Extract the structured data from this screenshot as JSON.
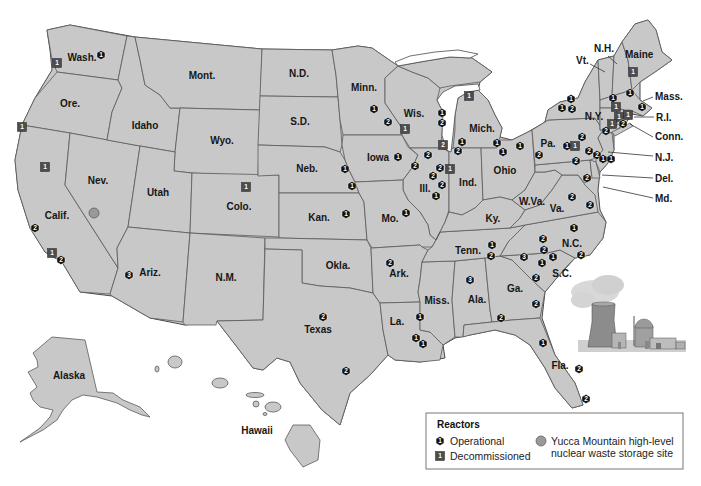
{
  "map": {
    "title": "Nuclear reactors in the United States",
    "colors": {
      "land": "#c8c8c8",
      "border": "#5a5a5a",
      "operational": "#111111",
      "decommissioned": "#4d4d4d",
      "yucca": "#9a9a9a"
    }
  },
  "legend": {
    "title": "Reactors",
    "operational": "Operational",
    "decommissioned": "Decommissioned",
    "yucca_line1": "Yucca Mountain high-level",
    "yucca_line2": "nuclear waste storage site",
    "operational_icon_num": "1",
    "decommissioned_icon_num": "1"
  },
  "state_labels": [
    {
      "text": "Wash.",
      "x": 82,
      "y": 61
    },
    {
      "text": "Ore.",
      "x": 70,
      "y": 107
    },
    {
      "text": "Calif.",
      "x": 57,
      "y": 219
    },
    {
      "text": "Nev.",
      "x": 98,
      "y": 184
    },
    {
      "text": "Idaho",
      "x": 145,
      "y": 129
    },
    {
      "text": "Mont.",
      "x": 202,
      "y": 79
    },
    {
      "text": "Wyo.",
      "x": 222,
      "y": 144
    },
    {
      "text": "Utah",
      "x": 158,
      "y": 196
    },
    {
      "text": "Ariz.",
      "x": 150,
      "y": 276
    },
    {
      "text": "Colo.",
      "x": 239,
      "y": 210
    },
    {
      "text": "N.M.",
      "x": 226,
      "y": 281
    },
    {
      "text": "N.D.",
      "x": 299,
      "y": 77
    },
    {
      "text": "S.D.",
      "x": 300,
      "y": 125
    },
    {
      "text": "Neb.",
      "x": 307,
      "y": 172
    },
    {
      "text": "Kan.",
      "x": 319,
      "y": 221
    },
    {
      "text": "Okla.",
      "x": 338,
      "y": 269
    },
    {
      "text": "Texas",
      "x": 318,
      "y": 333
    },
    {
      "text": "Minn.",
      "x": 364,
      "y": 91
    },
    {
      "text": "Iowa",
      "x": 378,
      "y": 161
    },
    {
      "text": "Mo.",
      "x": 390,
      "y": 222
    },
    {
      "text": "Ark.",
      "x": 399,
      "y": 277
    },
    {
      "text": "La.",
      "x": 397,
      "y": 325
    },
    {
      "text": "Wis.",
      "x": 414,
      "y": 117
    },
    {
      "text": "Ill.",
      "x": 425,
      "y": 192
    },
    {
      "text": "Miss.",
      "x": 437,
      "y": 304
    },
    {
      "text": "Mich.",
      "x": 482,
      "y": 132
    },
    {
      "text": "Ind.",
      "x": 468,
      "y": 186
    },
    {
      "text": "Ky.",
      "x": 493,
      "y": 222
    },
    {
      "text": "Tenn.",
      "x": 468,
      "y": 254
    },
    {
      "text": "Ala.",
      "x": 477,
      "y": 303
    },
    {
      "text": "Ohio",
      "x": 505,
      "y": 174
    },
    {
      "text": "W.Va.",
      "x": 532,
      "y": 205
    },
    {
      "text": "Va.",
      "x": 557,
      "y": 212
    },
    {
      "text": "N.C.",
      "x": 572,
      "y": 247
    },
    {
      "text": "S.C.",
      "x": 562,
      "y": 277
    },
    {
      "text": "Ga.",
      "x": 515,
      "y": 292
    },
    {
      "text": "Fla.",
      "x": 560,
      "y": 369
    },
    {
      "text": "Pa.",
      "x": 548,
      "y": 147
    },
    {
      "text": "N.Y.",
      "x": 594,
      "y": 120
    },
    {
      "text": "Alaska",
      "x": 69,
      "y": 379
    },
    {
      "text": "Hawaii",
      "x": 257,
      "y": 434
    }
  ],
  "callout_labels": [
    {
      "text": "N.H.",
      "x": 594,
      "y": 52,
      "line": [
        608,
        56,
        617,
        64
      ]
    },
    {
      "text": "Vt.",
      "x": 576,
      "y": 64,
      "line": [
        590,
        64,
        605,
        72
      ]
    },
    {
      "text": "Maine",
      "x": 625,
      "y": 58,
      "line": null
    },
    {
      "text": "Mass.",
      "x": 655,
      "y": 100,
      "line": [
        653,
        97,
        643,
        101
      ]
    },
    {
      "text": "R.I.",
      "x": 656,
      "y": 121,
      "line": [
        654,
        117,
        634,
        117
      ]
    },
    {
      "text": "Conn.",
      "x": 655,
      "y": 140,
      "line": [
        653,
        137,
        630,
        124
      ]
    },
    {
      "text": "N.J.",
      "x": 655,
      "y": 161,
      "line": [
        653,
        156,
        608,
        152
      ]
    },
    {
      "text": "Del.",
      "x": 655,
      "y": 182,
      "line": [
        653,
        178,
        602,
        175
      ]
    },
    {
      "text": "Md.",
      "x": 655,
      "y": 202,
      "line": [
        653,
        198,
        603,
        187
      ]
    }
  ],
  "reactors": [
    {
      "state": "Wash.",
      "type": "operational",
      "n": "1",
      "x": 101,
      "y": 55
    },
    {
      "state": "Wash.",
      "type": "decommissioned",
      "n": "1",
      "x": 57,
      "y": 63
    },
    {
      "state": "Ore.",
      "type": "decommissioned",
      "n": "1",
      "x": 22,
      "y": 127
    },
    {
      "state": "Calif.",
      "type": "decommissioned",
      "n": "1",
      "x": 45,
      "y": 167
    },
    {
      "state": "Calif.",
      "type": "operational",
      "n": "2",
      "x": 35,
      "y": 228
    },
    {
      "state": "Calif.",
      "type": "decommissioned",
      "n": "1",
      "x": 52,
      "y": 253
    },
    {
      "state": "Calif.",
      "type": "operational",
      "n": "2",
      "x": 61,
      "y": 260
    },
    {
      "state": "Ariz.",
      "type": "operational",
      "n": "3",
      "x": 129,
      "y": 275
    },
    {
      "state": "Colo.",
      "type": "decommissioned",
      "n": "1",
      "x": 246,
      "y": 187
    },
    {
      "state": "Minn.",
      "type": "operational",
      "n": "1",
      "x": 374,
      "y": 109
    },
    {
      "state": "Minn.",
      "type": "operational",
      "n": "2",
      "x": 388,
      "y": 122
    },
    {
      "state": "Wis.",
      "type": "decommissioned",
      "n": "1",
      "x": 405,
      "y": 129
    },
    {
      "state": "Wis.",
      "type": "operational",
      "n": "1",
      "x": 442,
      "y": 113
    },
    {
      "state": "Wis.",
      "type": "operational",
      "n": "2",
      "x": 442,
      "y": 123
    },
    {
      "state": "Ill.",
      "type": "decommissioned",
      "n": "2",
      "x": 443,
      "y": 145
    },
    {
      "state": "Mich.",
      "type": "decommissioned",
      "n": "1",
      "x": 469,
      "y": 96
    },
    {
      "state": "Mich.",
      "type": "operational",
      "n": "1",
      "x": 462,
      "y": 142
    },
    {
      "state": "Mich.",
      "type": "operational",
      "n": "2",
      "x": 458,
      "y": 151
    },
    {
      "state": "Iowa",
      "type": "operational",
      "n": "1",
      "x": 398,
      "y": 157
    },
    {
      "state": "Ill.",
      "type": "operational",
      "n": "2",
      "x": 428,
      "y": 155
    },
    {
      "state": "Ill.",
      "type": "operational",
      "n": "2",
      "x": 415,
      "y": 166
    },
    {
      "state": "Ill.",
      "type": "operational",
      "n": "2",
      "x": 440,
      "y": 168
    },
    {
      "state": "Ill.",
      "type": "decommissioned",
      "n": "1",
      "x": 450,
      "y": 169
    },
    {
      "state": "Ill.",
      "type": "operational",
      "n": "2",
      "x": 433,
      "y": 176
    },
    {
      "state": "Ill.",
      "type": "operational",
      "n": "2",
      "x": 442,
      "y": 185
    },
    {
      "state": "Ill.",
      "type": "operational",
      "n": "1",
      "x": 436,
      "y": 196
    },
    {
      "state": "Neb.",
      "type": "operational",
      "n": "1",
      "x": 345,
      "y": 169
    },
    {
      "state": "Neb.",
      "type": "operational",
      "n": "1",
      "x": 352,
      "y": 186
    },
    {
      "state": "Kan.",
      "type": "operational",
      "n": "1",
      "x": 346,
      "y": 214
    },
    {
      "state": "Mo.",
      "type": "operational",
      "n": "1",
      "x": 406,
      "y": 213
    },
    {
      "state": "Mich.",
      "type": "operational",
      "n": "1",
      "x": 497,
      "y": 143
    },
    {
      "state": "Ohio",
      "type": "operational",
      "n": "1",
      "x": 503,
      "y": 152
    },
    {
      "state": "Ohio",
      "type": "operational",
      "n": "1",
      "x": 520,
      "y": 146
    },
    {
      "state": "Pa.",
      "type": "operational",
      "n": "2",
      "x": 539,
      "y": 155
    },
    {
      "state": "Pa.",
      "type": "operational",
      "n": "1",
      "x": 567,
      "y": 146
    },
    {
      "state": "Pa.",
      "type": "decommissioned",
      "n": "1",
      "x": 575,
      "y": 146
    },
    {
      "state": "Pa.",
      "type": "operational",
      "n": "2",
      "x": 582,
      "y": 137
    },
    {
      "state": "Pa.",
      "type": "operational",
      "n": "2",
      "x": 589,
      "y": 151
    },
    {
      "state": "Pa.",
      "type": "operational",
      "n": "2",
      "x": 576,
      "y": 161
    },
    {
      "state": "N.J.",
      "type": "operational",
      "n": "2",
      "x": 597,
      "y": 155
    },
    {
      "state": "N.J.",
      "type": "operational",
      "n": "1",
      "x": 603,
      "y": 159
    },
    {
      "state": "N.J.",
      "type": "operational",
      "n": "1",
      "x": 611,
      "y": 159
    },
    {
      "state": "N.Y.",
      "type": "operational",
      "n": "1",
      "x": 571,
      "y": 99
    },
    {
      "state": "N.Y.",
      "type": "operational",
      "n": "1",
      "x": 562,
      "y": 108
    },
    {
      "state": "N.Y.",
      "type": "operational",
      "n": "2",
      "x": 572,
      "y": 109
    },
    {
      "state": "N.Y.",
      "type": "operational",
      "n": "2",
      "x": 606,
      "y": 131
    },
    {
      "state": "Maine",
      "type": "decommissioned",
      "n": "1",
      "x": 633,
      "y": 72
    },
    {
      "state": "N.H.",
      "type": "operational",
      "n": "1",
      "x": 630,
      "y": 93
    },
    {
      "state": "Vt.",
      "type": "operational",
      "n": "1",
      "x": 613,
      "y": 98
    },
    {
      "state": "Mass.",
      "type": "operational",
      "n": "1",
      "x": 642,
      "y": 107
    },
    {
      "state": "Mass.",
      "type": "decommissioned",
      "n": "1",
      "x": 616,
      "y": 107
    },
    {
      "state": "Conn.",
      "type": "decommissioned",
      "n": "1",
      "x": 619,
      "y": 117
    },
    {
      "state": "Conn.",
      "type": "decommissioned",
      "n": "1",
      "x": 628,
      "y": 115
    },
    {
      "state": "N.Y.",
      "type": "decommissioned",
      "n": "1",
      "x": 612,
      "y": 124
    },
    {
      "state": "Conn.",
      "type": "operational",
      "n": "2",
      "x": 623,
      "y": 124
    },
    {
      "state": "Md.",
      "type": "operational",
      "n": "2",
      "x": 587,
      "y": 178
    },
    {
      "state": "Va.",
      "type": "operational",
      "n": "2",
      "x": 572,
      "y": 197
    },
    {
      "state": "Va.",
      "type": "operational",
      "n": "2",
      "x": 590,
      "y": 205
    },
    {
      "state": "N.C.",
      "type": "operational",
      "n": "1",
      "x": 574,
      "y": 228
    },
    {
      "state": "N.C.",
      "type": "operational",
      "n": "2",
      "x": 543,
      "y": 239
    },
    {
      "state": "N.C.",
      "type": "operational",
      "n": "2",
      "x": 581,
      "y": 255
    },
    {
      "state": "S.C.",
      "type": "operational",
      "n": "2",
      "x": 544,
      "y": 250
    },
    {
      "state": "S.C.",
      "type": "operational",
      "n": "1",
      "x": 553,
      "y": 257
    },
    {
      "state": "S.C.",
      "type": "operational",
      "n": "1",
      "x": 542,
      "y": 263
    },
    {
      "state": "S.C.",
      "type": "operational",
      "n": "3",
      "x": 524,
      "y": 257
    },
    {
      "state": "Ga.",
      "type": "operational",
      "n": "2",
      "x": 536,
      "y": 278
    },
    {
      "state": "Tenn.",
      "type": "operational",
      "n": "1",
      "x": 492,
      "y": 245
    },
    {
      "state": "Tenn.",
      "type": "operational",
      "n": "2",
      "x": 491,
      "y": 256
    },
    {
      "state": "Ark.",
      "type": "operational",
      "n": "2",
      "x": 390,
      "y": 263
    },
    {
      "state": "Ala.",
      "type": "operational",
      "n": "3",
      "x": 470,
      "y": 280
    },
    {
      "state": "Ga.",
      "type": "operational",
      "n": "2",
      "x": 536,
      "y": 304
    },
    {
      "state": "Ala.",
      "type": "operational",
      "n": "2",
      "x": 501,
      "y": 318
    },
    {
      "state": "Miss.",
      "type": "operational",
      "n": "1",
      "x": 420,
      "y": 317
    },
    {
      "state": "La.",
      "type": "operational",
      "n": "1",
      "x": 416,
      "y": 338
    },
    {
      "state": "La.",
      "type": "operational",
      "n": "1",
      "x": 423,
      "y": 344
    },
    {
      "state": "Fla.",
      "type": "operational",
      "n": "1",
      "x": 543,
      "y": 343
    },
    {
      "state": "Fla.",
      "type": "operational",
      "n": "2",
      "x": 579,
      "y": 369
    },
    {
      "state": "Fla.",
      "type": "operational",
      "n": "2",
      "x": 586,
      "y": 399
    },
    {
      "state": "Texas",
      "type": "operational",
      "n": "2",
      "x": 323,
      "y": 317
    },
    {
      "state": "Texas",
      "type": "operational",
      "n": "2",
      "x": 346,
      "y": 371
    }
  ],
  "yucca_mountain": {
    "x": 94,
    "y": 213,
    "label": "Yucca Mountain"
  }
}
